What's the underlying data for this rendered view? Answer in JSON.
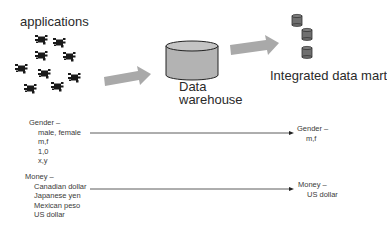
{
  "diagram": {
    "colors": {
      "arrow_fill": "#a9a9a9",
      "cylinder_fill": "#b3b3b3",
      "cylinder_stroke": "#222222",
      "mart_fill": "#6f6f6f",
      "app_icon": "#1a1a1a",
      "line": "#333333"
    },
    "nodes": {
      "applications": {
        "label": "applications",
        "icon": "application-component-icon",
        "icon_count": 9
      },
      "warehouse": {
        "label_line1": "Data",
        "label_line2": "warehouse",
        "icon": "database-cylinder-icon"
      },
      "mart": {
        "label": "Integrated data mart",
        "icon": "small-database-cylinder-icon",
        "icon_count": 3
      }
    },
    "flows": [
      {
        "from": "applications",
        "to": "warehouse",
        "icon": "block-arrow-right-icon"
      },
      {
        "from": "warehouse",
        "to": "mart",
        "icon": "block-arrow-right-icon"
      }
    ],
    "mappings": [
      {
        "source": {
          "heading": "Gender –",
          "values": [
            "male, female",
            "m,f",
            "1,0",
            "x,y"
          ]
        },
        "target": {
          "heading": "Gender –",
          "values": [
            "m,f"
          ]
        }
      },
      {
        "source": {
          "heading": "Money –",
          "values": [
            "Canadian dollar",
            "Japanese yen",
            "Mexican peso",
            "US dollar"
          ]
        },
        "target": {
          "heading": "Money –",
          "values": [
            "US dollar"
          ]
        }
      }
    ]
  }
}
